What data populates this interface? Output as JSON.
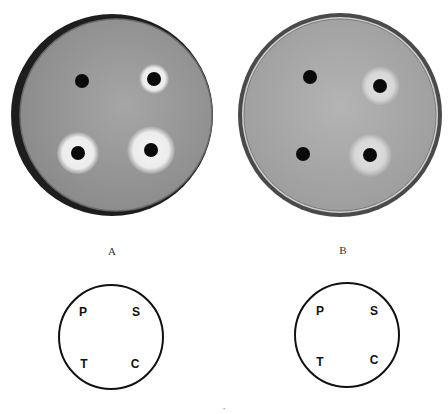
{
  "figure": {
    "panels": [
      {
        "label": "A",
        "dish": {
          "cx": 112,
          "cy": 115,
          "r": 100,
          "agar": "#9a9a9a",
          "rim": "#2a2a2a"
        },
        "wells": [
          {
            "id": "P",
            "x": 82,
            "y": 81,
            "halo": 0
          },
          {
            "id": "S",
            "x": 154,
            "y": 79,
            "halo": 15
          },
          {
            "id": "T",
            "x": 78,
            "y": 153,
            "halo": 21
          },
          {
            "id": "C",
            "x": 151,
            "y": 150,
            "halo": 24
          }
        ],
        "key": {
          "cx": 111,
          "cy": 337,
          "r": 52,
          "letters": [
            "P",
            "S",
            "T",
            "C"
          ]
        }
      },
      {
        "label": "B",
        "dish": {
          "cx": 340,
          "cy": 115,
          "r": 101,
          "agar": "#a8a8a8",
          "rim": "#555555"
        },
        "wells": [
          {
            "id": "P",
            "x": 310,
            "y": 77,
            "halo": 0
          },
          {
            "id": "S",
            "x": 380,
            "y": 86,
            "halo": 20
          },
          {
            "id": "T",
            "x": 303,
            "y": 154,
            "halo": 0
          },
          {
            "id": "C",
            "x": 370,
            "y": 155,
            "halo": 22
          }
        ],
        "key": {
          "cx": 347,
          "cy": 335,
          "r": 52,
          "letters": [
            "P",
            "S",
            "T",
            "C"
          ]
        }
      }
    ],
    "caption_fragment": "·"
  }
}
